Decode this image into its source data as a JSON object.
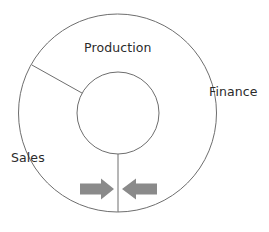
{
  "diagram": {
    "type": "concentric-circle-segment-diagram",
    "background_color": "#ffffff",
    "line_color": "#6e6e6e",
    "text_color": "#2b2b2b",
    "arrow_color": "#8a8a8a",
    "outer_circle": {
      "cx": 117.5,
      "cy": 113,
      "r": 99
    },
    "inner_circle": {
      "cx": 118,
      "cy": 113,
      "r": 41
    },
    "segments": [
      {
        "id": "production",
        "label": "Production"
      },
      {
        "id": "finance",
        "label": "Finance"
      },
      {
        "id": "sales",
        "label": "Sales"
      }
    ],
    "dividers": [
      {
        "id": "divider-upper-left",
        "angle_deg": 151
      },
      {
        "id": "divider-bottom",
        "angle_deg": 270
      }
    ],
    "arrows": [
      {
        "id": "arrow-left",
        "direction": "right",
        "label": ""
      },
      {
        "id": "arrow-right",
        "direction": "left",
        "label": ""
      }
    ]
  }
}
